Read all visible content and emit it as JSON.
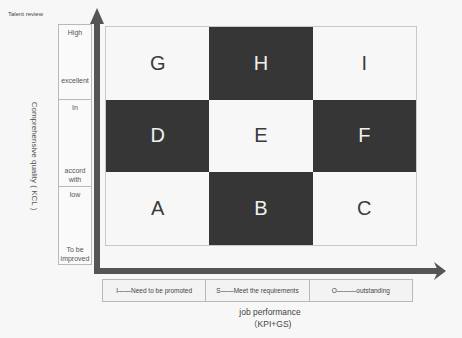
{
  "caption": "Talent review",
  "y_axis": {
    "label": "Comprehensive quality ( KCL )",
    "bands": [
      {
        "top": "High",
        "bottom": "excellent"
      },
      {
        "top": "In",
        "bottom": "accord with"
      },
      {
        "top": "low",
        "bottom": "To be improved"
      }
    ]
  },
  "x_axis": {
    "label_line1": "job performance",
    "label_line2": "（KPI+GS)"
  },
  "grid": {
    "rows": [
      [
        {
          "label": "G",
          "shade": "light"
        },
        {
          "label": "H",
          "shade": "dark"
        },
        {
          "label": "I",
          "shade": "light"
        }
      ],
      [
        {
          "label": "D",
          "shade": "dark"
        },
        {
          "label": "E",
          "shade": "light"
        },
        {
          "label": "F",
          "shade": "dark"
        }
      ],
      [
        {
          "label": "A",
          "shade": "light"
        },
        {
          "label": "B",
          "shade": "dark"
        },
        {
          "label": "C",
          "shade": "light"
        }
      ]
    ]
  },
  "legend": [
    {
      "text": "I——Need to be promoted"
    },
    {
      "text": "S——Meet the requirements"
    },
    {
      "text": "O———outstanding"
    }
  ],
  "colors": {
    "dark_cell": "#363636",
    "light_cell": "#f7f7f7",
    "axis_arrow": "#555555"
  }
}
